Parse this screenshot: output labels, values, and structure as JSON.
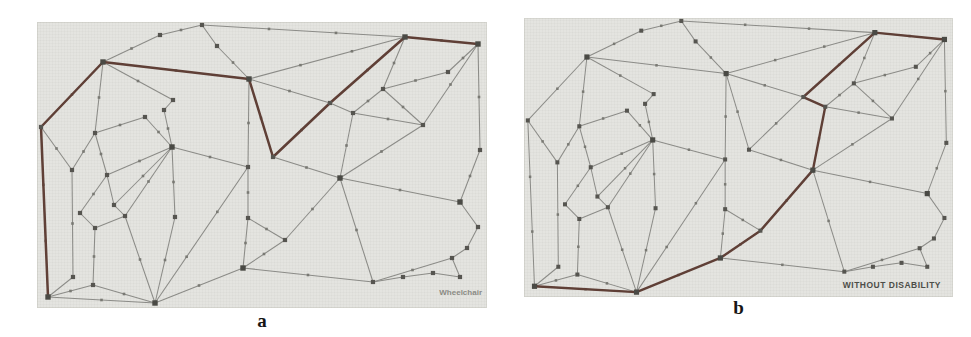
{
  "figure": {
    "panels": [
      {
        "id": "a",
        "caption": "a",
        "corner_label": "Wheelchair",
        "highlight_path": [
          0,
          1,
          2,
          5,
          8,
          11,
          6,
          7
        ]
      },
      {
        "id": "b",
        "caption": "b",
        "corner_label": "WITHOUT DISABILITY",
        "highlight_path": [
          0,
          26,
          25,
          27,
          10,
          12,
          11,
          6,
          7
        ]
      }
    ],
    "colors": {
      "panel_bg": "#e4e4e0",
      "edge": "#8b8b87",
      "edge_marker": "#797973",
      "node": "#565550",
      "hub_node": "#4a4a45",
      "route": "#5f3f36",
      "caption_text": "#161616",
      "corner_label_a": "#8b8b85",
      "corner_label_b": "#4d4d48"
    },
    "graph": {
      "nodes": [
        [
          11,
          275
        ],
        [
          4,
          105
        ],
        [
          66,
          40
        ],
        [
          123,
          13
        ],
        [
          165,
          3
        ],
        [
          212,
          57
        ],
        [
          368,
          15
        ],
        [
          441,
          22
        ],
        [
          236,
          135
        ],
        [
          211,
          145
        ],
        [
          303,
          156
        ],
        [
          293,
          81
        ],
        [
          316,
          91
        ],
        [
          386,
          103
        ],
        [
          346,
          67
        ],
        [
          411,
          50
        ],
        [
          443,
          128
        ],
        [
          423,
          180
        ],
        [
          441,
          205
        ],
        [
          430,
          226
        ],
        [
          415,
          236
        ],
        [
          423,
          255
        ],
        [
          396,
          251
        ],
        [
          366,
          255
        ],
        [
          336,
          260
        ],
        [
          206,
          246
        ],
        [
          118,
          281
        ],
        [
          248,
          218
        ],
        [
          211,
          196
        ],
        [
          135,
          125
        ],
        [
          35,
          148
        ],
        [
          58,
          111
        ],
        [
          108,
          95
        ],
        [
          70,
          153
        ],
        [
          77,
          183
        ],
        [
          88,
          194
        ],
        [
          43,
          191
        ],
        [
          58,
          206
        ],
        [
          36,
          255
        ],
        [
          56,
          263
        ],
        [
          138,
          195
        ],
        [
          136,
          78
        ],
        [
          127,
          88
        ],
        [
          180,
          24
        ]
      ],
      "hub_nodes": [
        0,
        2,
        5,
        6,
        7,
        10,
        17,
        25,
        26,
        29
      ],
      "edges": [
        [
          0,
          1
        ],
        [
          1,
          2
        ],
        [
          2,
          3
        ],
        [
          3,
          4
        ],
        [
          4,
          43
        ],
        [
          43,
          5
        ],
        [
          4,
          6
        ],
        [
          6,
          7
        ],
        [
          7,
          16
        ],
        [
          16,
          17
        ],
        [
          17,
          18
        ],
        [
          18,
          19
        ],
        [
          19,
          20
        ],
        [
          20,
          21
        ],
        [
          21,
          22
        ],
        [
          22,
          23
        ],
        [
          23,
          24
        ],
        [
          24,
          25
        ],
        [
          25,
          26
        ],
        [
          26,
          0
        ],
        [
          2,
          5
        ],
        [
          5,
          8
        ],
        [
          8,
          11
        ],
        [
          11,
          6
        ],
        [
          5,
          9
        ],
        [
          5,
          11
        ],
        [
          5,
          6
        ],
        [
          9,
          28
        ],
        [
          28,
          25
        ],
        [
          9,
          29
        ],
        [
          8,
          10
        ],
        [
          10,
          12
        ],
        [
          12,
          11
        ],
        [
          10,
          13
        ],
        [
          10,
          17
        ],
        [
          10,
          27
        ],
        [
          27,
          25
        ],
        [
          27,
          28
        ],
        [
          10,
          24
        ],
        [
          12,
          13
        ],
        [
          12,
          14
        ],
        [
          14,
          6
        ],
        [
          14,
          15
        ],
        [
          15,
          7
        ],
        [
          13,
          7
        ],
        [
          13,
          14
        ],
        [
          24,
          20
        ],
        [
          9,
          26
        ],
        [
          2,
          41
        ],
        [
          41,
          42
        ],
        [
          42,
          29
        ],
        [
          2,
          31
        ],
        [
          1,
          30
        ],
        [
          30,
          31
        ],
        [
          30,
          38
        ],
        [
          38,
          0
        ],
        [
          0,
          39
        ],
        [
          39,
          37
        ],
        [
          39,
          26
        ],
        [
          26,
          35
        ],
        [
          26,
          40
        ],
        [
          29,
          40
        ],
        [
          29,
          33
        ],
        [
          29,
          35
        ],
        [
          29,
          34
        ],
        [
          31,
          32
        ],
        [
          32,
          29
        ],
        [
          31,
          33
        ],
        [
          33,
          34
        ],
        [
          34,
          35
        ],
        [
          36,
          37
        ],
        [
          37,
          35
        ],
        [
          36,
          33
        ]
      ]
    }
  }
}
